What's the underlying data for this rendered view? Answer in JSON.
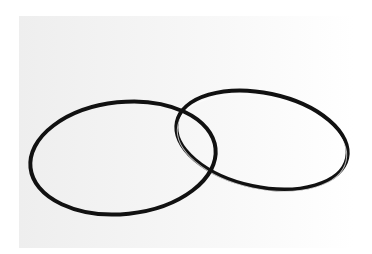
{
  "image": {
    "description": "Two thin black rubber rings overlapping on a white background",
    "background_color": "#ffffff",
    "photo_backdrop_color": "#f2f2f2",
    "ring_color": "#111111",
    "objects": [
      {
        "name": "left-ring",
        "cx": 123,
        "cy": 158,
        "rx": 93,
        "ry": 56,
        "rotate": -8
      },
      {
        "name": "right-ring",
        "cx": 262,
        "cy": 140,
        "rx": 87,
        "ry": 47,
        "rotate": 12
      }
    ]
  }
}
